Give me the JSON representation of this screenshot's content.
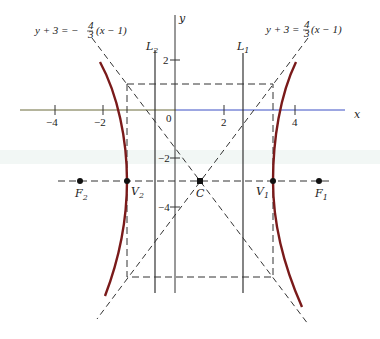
{
  "diagram": {
    "type": "hyperbola",
    "axes": {
      "x_label": "x",
      "y_label": "y",
      "x_ticks": [
        "−4",
        "−2",
        "0",
        "2",
        "4"
      ],
      "y_ticks": [
        "2",
        "−2",
        "−4"
      ]
    },
    "asymptotes": {
      "left_equation": "y + 3 = −4/3 (x − 1)",
      "left_prefix": "y + 3 = −",
      "left_frac_num": "4",
      "left_frac_den": "3",
      "left_suffix": "(x − 1)",
      "right_prefix": "y + 3 = ",
      "right_frac_num": "4",
      "right_frac_den": "3",
      "right_suffix": "(x − 1)",
      "right_equation": "y + 3 = 4/3 (x − 1)"
    },
    "lines": {
      "L1": {
        "label": "L",
        "sub": "1"
      },
      "L2": {
        "label": "L",
        "sub": "2"
      }
    },
    "points": {
      "center": {
        "label": "C"
      },
      "V1": {
        "label": "V",
        "sub": "1"
      },
      "V2": {
        "label": "V",
        "sub": "2"
      },
      "F1": {
        "label": "F",
        "sub": "1"
      },
      "F2": {
        "label": "F",
        "sub": "2"
      }
    },
    "colors": {
      "curve": "#7a1a1a",
      "lines": "#333333",
      "x_axis_right": "#3a4fc4",
      "x_axis_left": "#6b6b3a"
    }
  }
}
